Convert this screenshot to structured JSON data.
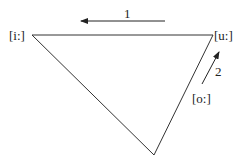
{
  "diagram": {
    "vertices": [
      {
        "label": "[i:]",
        "x": 32,
        "y": 35
      },
      {
        "label": "[u:]",
        "x": 213,
        "y": 35
      },
      {
        "label": "",
        "x": 154,
        "y": 155
      }
    ],
    "arrows": [
      {
        "label": "1",
        "from": [
          165,
          21
        ],
        "to": [
          80,
          21
        ]
      },
      {
        "label": "2",
        "from": [
          202,
          84
        ],
        "to": [
          220,
          50
        ]
      }
    ],
    "extra_labels": [
      {
        "label": "[o:]",
        "x": 192,
        "y": 103
      }
    ],
    "line_color": "#333333"
  }
}
